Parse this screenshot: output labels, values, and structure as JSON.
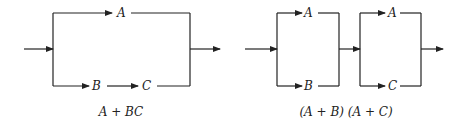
{
  "diagrams": [
    {
      "name": "series-parallel-A-plus-BC",
      "labels": {
        "top": "A",
        "bottom_first": "B",
        "bottom_second": "C"
      },
      "caption": "A + BC"
    },
    {
      "name": "parallel-series-AB-AC",
      "labels": {
        "block1_top": "A",
        "block1_bottom": "B",
        "block2_top": "A",
        "block2_bottom": "C"
      },
      "caption": "(A + B) (A + C)"
    }
  ],
  "colors": {
    "stroke": "#222222",
    "background": "#ffffff"
  }
}
